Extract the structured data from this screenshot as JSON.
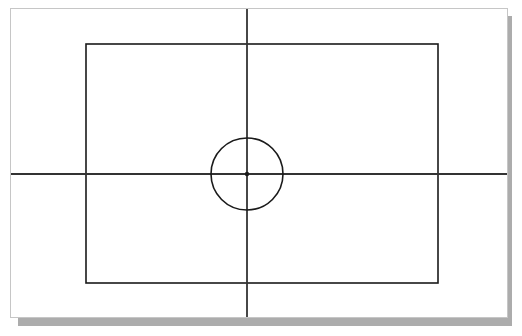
{
  "canvas": {
    "width": 522,
    "height": 336,
    "background": "#ffffff"
  },
  "outer_frame": {
    "name": "outer-frame",
    "x": 10,
    "y": 8,
    "width": 498,
    "height": 310,
    "fill": "#ffffff",
    "stroke": "#c6c6c6",
    "stroke_width": 1
  },
  "shadow": {
    "name": "frame-shadow",
    "x": 18,
    "y": 16,
    "width": 494,
    "height": 310,
    "color": "#a8a8a8"
  },
  "inner_rect": {
    "name": "inner-rectangle",
    "x": 86,
    "y": 44,
    "width": 352,
    "height": 239,
    "stroke": "#1a1a1a",
    "stroke_width": 1.6,
    "fill": "none"
  },
  "crosshair": {
    "center_x": 247,
    "center_y": 174,
    "stroke": "#333333",
    "stroke_width": 1.8,
    "vertical": {
      "x": 247,
      "y1": 9,
      "y2": 317
    },
    "horizontal": {
      "y": 174,
      "x1": 11,
      "x2": 507
    }
  },
  "circle": {
    "name": "center-circle",
    "cx": 247,
    "cy": 174,
    "r": 36,
    "stroke": "#1a1a1a",
    "stroke_width": 1.6,
    "fill": "none"
  },
  "center_dot": {
    "name": "center-dot",
    "cx": 247,
    "cy": 174,
    "r": 2.2,
    "fill": "#1a1a1a"
  }
}
